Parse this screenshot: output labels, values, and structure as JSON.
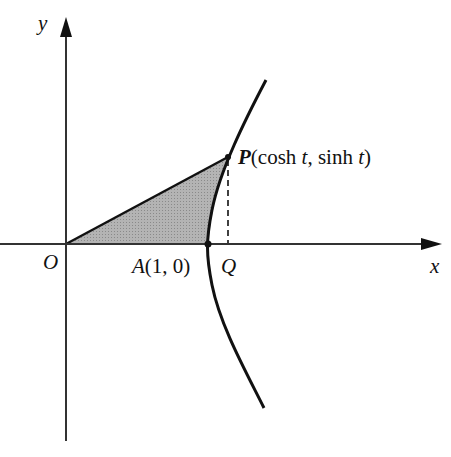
{
  "diagram": {
    "type": "unit-hyperbola-sector",
    "axes": {
      "x_label": "x",
      "y_label": "y",
      "origin_label": "O"
    },
    "points": {
      "A": {
        "name": "A",
        "coords": "(1, 0)"
      },
      "Q": {
        "name": "Q"
      },
      "P": {
        "name": "P",
        "coords_open": "(cosh ",
        "t1": "t",
        "mid": ", sinh ",
        "t2": "t",
        "close": ")"
      }
    },
    "curve": "x² − y² = 1 (right branch)",
    "shaded_region": "hyperbolic sector OAP",
    "colors": {
      "stroke": "#111111",
      "shade": "#a9a9a9",
      "background": "#ffffff"
    }
  }
}
